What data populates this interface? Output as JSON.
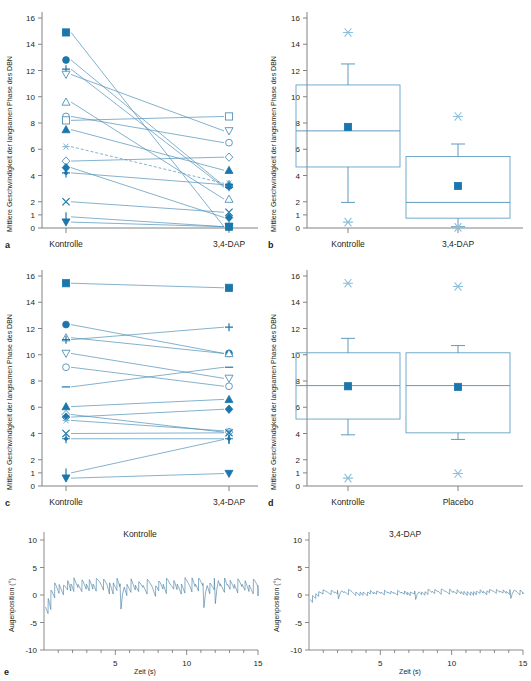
{
  "figure": {
    "accent": "#1b76ab",
    "accent_light": "#63a2c6",
    "trace_color": "#3c78a0",
    "axis_color": "#808285"
  },
  "panels": {
    "a": {
      "label": "a",
      "ylabel": "Mittlere Geschwindigkeit der langsamen Phase des DBN",
      "categories": [
        "Kontrolle",
        "3,4-DAP"
      ],
      "yticks": [
        "0",
        "1",
        "2",
        "4",
        "6",
        "8",
        "10",
        "12",
        "14",
        "16"
      ]
    },
    "b": {
      "label": "b",
      "ylabel": "Mittlere Geschwindigkeit der langsamen Phase des DBN",
      "categories": [
        "Kontrolle",
        "3,4-DAP"
      ],
      "yticks": [
        "0",
        "1",
        "2",
        "4",
        "6",
        "8",
        "10",
        "12",
        "14",
        "16"
      ]
    },
    "c": {
      "label": "c",
      "ylabel": "Mittlere Geschwindigkeit der langsamen Phase des DBN",
      "categories": [
        "Kontrolle",
        "3,4-DAP"
      ],
      "yticks": [
        "0",
        "1",
        "2",
        "4",
        "6",
        "8",
        "10",
        "12",
        "14",
        "16"
      ]
    },
    "d": {
      "label": "d",
      "ylabel": "Mittlere Geschwindigkeit der langsamen Phase des DBN",
      "categories": [
        "Kontrolle",
        "Placebo"
      ],
      "yticks": [
        "0",
        "1",
        "2",
        "4",
        "6",
        "8",
        "10",
        "12",
        "14",
        "16"
      ]
    },
    "e": {
      "label": "e",
      "left_title": "Kontrolle",
      "right_title": "3,4-DAP",
      "ylabel": "Augenposition (°)",
      "xlabel": "Zeit (s)",
      "yticks": [
        "-10",
        "-5",
        "0",
        "5",
        "10"
      ],
      "xticks": [
        "5",
        "10",
        "15"
      ]
    }
  },
  "chart_data": [
    {
      "type": "line",
      "panel": "a",
      "title": "",
      "xlabel": "",
      "ylabel": "Mittlere Geschwindigkeit der langsamen Phase des DBN",
      "categories": [
        "Kontrolle",
        "3,4-DAP"
      ],
      "ylim": [
        0,
        16
      ],
      "ytick_values": [
        0,
        1,
        2,
        4,
        6,
        8,
        10,
        12,
        14,
        16
      ],
      "grid": false,
      "legend": "none",
      "series": [
        {
          "name": "subject-1",
          "marker": "filled-square",
          "values": [
            14.9,
            0.1
          ]
        },
        {
          "name": "subject-2",
          "marker": "filled-circle",
          "values": [
            12.8,
            3.2
          ]
        },
        {
          "name": "subject-3",
          "marker": "plus",
          "values": [
            12.1,
            3.1
          ]
        },
        {
          "name": "subject-4",
          "marker": "open-down-triangle",
          "values": [
            11.7,
            7.4
          ]
        },
        {
          "name": "subject-5",
          "marker": "open-up-triangle",
          "values": [
            9.6,
            2.2
          ]
        },
        {
          "name": "subject-6",
          "marker": "open-circle",
          "values": [
            8.5,
            6.5
          ]
        },
        {
          "name": "subject-7",
          "marker": "open-square",
          "values": [
            8.2,
            8.5
          ]
        },
        {
          "name": "subject-8",
          "marker": "filled-up-triangle",
          "values": [
            7.5,
            4.4
          ]
        },
        {
          "name": "subject-9",
          "marker": "asterisk",
          "values": [
            6.2,
            3.4
          ]
        },
        {
          "name": "subject-10",
          "marker": "open-diamond",
          "values": [
            5.1,
            5.4
          ]
        },
        {
          "name": "subject-11",
          "marker": "filled-diamond",
          "values": [
            4.6,
            0.8
          ]
        },
        {
          "name": "subject-12",
          "marker": "filled-plus",
          "values": [
            4.2,
            3.3
          ]
        },
        {
          "name": "subject-13",
          "marker": "cross-x",
          "values": [
            2.0,
            1.2
          ]
        },
        {
          "name": "subject-14",
          "marker": "vertical-bar",
          "values": [
            0.85,
            0.1
          ]
        },
        {
          "name": "subject-15",
          "marker": "filled-down-triangle",
          "values": [
            0.45,
            0.1
          ]
        }
      ]
    },
    {
      "type": "boxplot",
      "panel": "b",
      "title": "",
      "xlabel": "",
      "ylabel": "Mittlere Geschwindigkeit der langsamen Phase des DBN",
      "categories": [
        "Kontrolle",
        "3,4-DAP"
      ],
      "ylim": [
        0,
        16
      ],
      "ytick_values": [
        0,
        1,
        2,
        4,
        6,
        8,
        10,
        12,
        14,
        16
      ],
      "grid": false,
      "boxes": [
        {
          "category": "Kontrolle",
          "q1": 4.65,
          "median": 7.4,
          "q3": 10.9,
          "whisker_low": 1.95,
          "whisker_high": 12.5,
          "mean": 7.7,
          "outliers": [
            14.9,
            0.45
          ]
        },
        {
          "category": "3,4-DAP",
          "q1": 0.75,
          "median": 1.95,
          "q3": 5.45,
          "whisker_low": 0.1,
          "whisker_high": 6.4,
          "mean": 3.2,
          "outliers": [
            8.5,
            0.05
          ]
        }
      ]
    },
    {
      "type": "line",
      "panel": "c",
      "title": "",
      "xlabel": "",
      "ylabel": "Mittlere Geschwindigkeit der langsamen Phase des DBN",
      "categories": [
        "Kontrolle",
        "3,4-DAP"
      ],
      "ylim": [
        0,
        16
      ],
      "ytick_values": [
        0,
        1,
        2,
        4,
        6,
        8,
        10,
        12,
        14,
        16
      ],
      "grid": false,
      "legend": "none",
      "series": [
        {
          "name": "subject-1",
          "marker": "filled-square",
          "values": [
            15.45,
            15.1
          ]
        },
        {
          "name": "subject-2",
          "marker": "filled-circle",
          "values": [
            12.3,
            10.1
          ]
        },
        {
          "name": "subject-3",
          "marker": "open-up-triangle",
          "values": [
            11.3,
            10.1
          ]
        },
        {
          "name": "subject-4",
          "marker": "plus",
          "values": [
            11.15,
            12.1
          ]
        },
        {
          "name": "subject-5",
          "marker": "open-down-triangle",
          "values": [
            10.1,
            8.2
          ]
        },
        {
          "name": "subject-6",
          "marker": "open-circle",
          "values": [
            9.05,
            7.6
          ]
        },
        {
          "name": "subject-7",
          "marker": "dash",
          "values": [
            7.55,
            9.05
          ]
        },
        {
          "name": "subject-8",
          "marker": "filled-up-triangle",
          "values": [
            6.05,
            6.6
          ]
        },
        {
          "name": "subject-9",
          "marker": "open-diamond",
          "values": [
            5.45,
            4.1
          ]
        },
        {
          "name": "subject-10",
          "marker": "filled-diamond",
          "values": [
            5.25,
            5.85
          ]
        },
        {
          "name": "subject-11",
          "marker": "asterisk",
          "values": [
            5.0,
            4.2
          ]
        },
        {
          "name": "subject-12",
          "marker": "cross-x",
          "values": [
            4.0,
            4.05
          ]
        },
        {
          "name": "subject-13",
          "marker": "filled-plus",
          "values": [
            3.6,
            3.6
          ]
        },
        {
          "name": "subject-14",
          "marker": "vertical-bar",
          "values": [
            1.0,
            3.55
          ]
        },
        {
          "name": "subject-15",
          "marker": "filled-down-triangle",
          "values": [
            0.6,
            0.95
          ]
        }
      ]
    },
    {
      "type": "boxplot",
      "panel": "d",
      "title": "",
      "xlabel": "",
      "ylabel": "Mittlere Geschwindigkeit der langsamen Phase des DBN",
      "categories": [
        "Kontrolle",
        "Placebo"
      ],
      "ylim": [
        0,
        16
      ],
      "ytick_values": [
        0,
        1,
        2,
        4,
        6,
        8,
        10,
        12,
        14,
        16
      ],
      "grid": false,
      "boxes": [
        {
          "category": "Kontrolle",
          "q1": 5.1,
          "median": 7.65,
          "q3": 10.15,
          "whisker_low": 3.9,
          "whisker_high": 11.25,
          "mean": 7.6,
          "outliers": [
            15.45,
            0.6
          ]
        },
        {
          "category": "Placebo",
          "q1": 4.05,
          "median": 7.65,
          "q3": 10.15,
          "whisker_low": 3.55,
          "whisker_high": 10.7,
          "mean": 7.55,
          "outliers": [
            15.2,
            0.95
          ]
        }
      ]
    },
    {
      "type": "line",
      "panel": "e-left",
      "title": "Kontrolle",
      "xlabel": "Zeit (s)",
      "ylabel": "Augenposition (°)",
      "ylim": [
        -10,
        10
      ],
      "xlim": [
        0,
        15
      ],
      "ytick_values": [
        -10,
        -5,
        0,
        5,
        10
      ],
      "xtick_values": [
        5,
        10,
        15
      ],
      "grid": false,
      "description": "Downbeat-Nystagmus Augenpositionsspur, Sägezahnmuster, Amplitude ca. -5 bis +5 Grad"
    },
    {
      "type": "line",
      "panel": "e-right",
      "title": "3,4-DAP",
      "xlabel": "Zeit (s)",
      "ylabel": "Augenposition (°)",
      "ylim": [
        -10,
        10
      ],
      "xlim": [
        0,
        15
      ],
      "ytick_values": [
        -10,
        -5,
        0,
        5,
        10
      ],
      "xtick_values": [
        5,
        10,
        15
      ],
      "grid": false,
      "description": "Augenpositionsspur nach 3,4-DAP, stark reduzierte Amplitude ca. -2 bis +2 Grad"
    }
  ]
}
